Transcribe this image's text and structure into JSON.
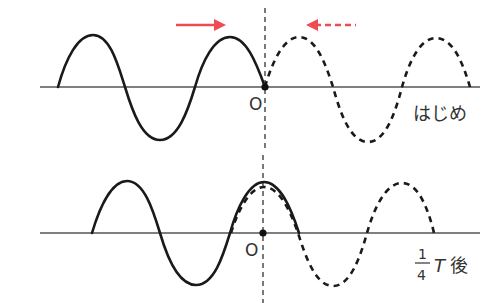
{
  "diagram": {
    "title": "",
    "colors": {
      "wave": "#1a1a1a",
      "axis": "#444444",
      "arrow": "#ee4b55",
      "text": "#333333"
    },
    "panels": [
      {
        "id": "initial",
        "label": "はじめ",
        "origin_label": "O",
        "axis_y": 87,
        "solid_wave": {
          "direction": "right",
          "arrow": "→"
        },
        "dashed_wave": {
          "direction": "left",
          "arrow": "←"
        }
      },
      {
        "id": "quarter-period",
        "label_fraction_numerator": "1",
        "label_fraction_denominator": "4",
        "label_symbol": "T",
        "label_suffix": "後",
        "origin_label": "O",
        "axis_y": 233
      }
    ]
  }
}
